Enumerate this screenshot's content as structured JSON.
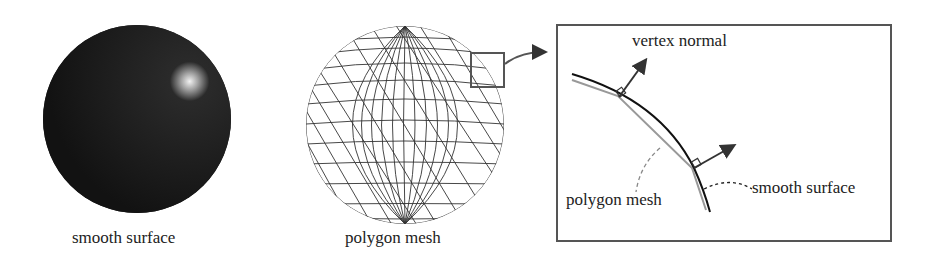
{
  "panels": {
    "smooth": {
      "caption": "smooth surface"
    },
    "mesh": {
      "caption": "polygon mesh"
    },
    "detail": {
      "vertex_normal_label": "vertex normal",
      "polygon_mesh_label": "polygon mesh",
      "smooth_surface_label": "smooth surface"
    }
  },
  "colors": {
    "sphere_dark": "#141414",
    "highlight": "#f0f0f0",
    "mesh_line": "#333333",
    "frame": "#555555",
    "smooth_curve": "#111111",
    "mesh_curve": "#999999",
    "arrow": "#333333"
  }
}
